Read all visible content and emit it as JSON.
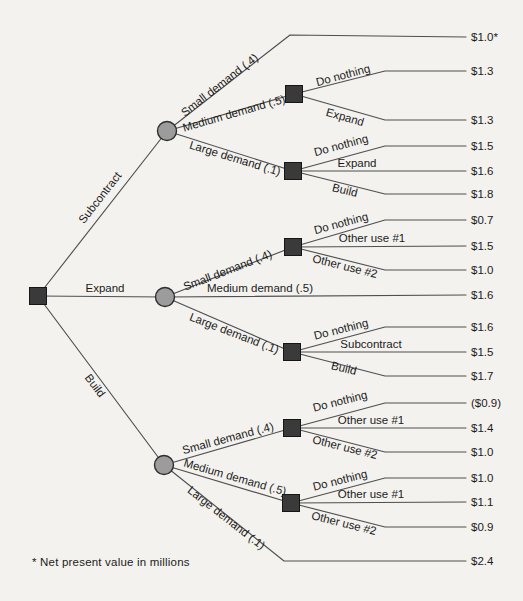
{
  "figure": {
    "kind": "decision-tree",
    "footnote": "* Net present value in millions",
    "canvas": {
      "width": 523,
      "height": 601,
      "background": "#f3f2ee"
    },
    "styles": {
      "line_color": "#4f4f4f",
      "line_width": 1.15,
      "text_color": "#1b1b1b",
      "label_font_size": 11.5,
      "value_font_size": 11.5,
      "decision_fill": "#3a3a3a",
      "decision_stroke": "#161616",
      "decision_size": 17,
      "chance_fill": "#9c9c9c",
      "chance_stroke": "#2e2e2e",
      "chance_radius": 9.5,
      "value_x": 471
    },
    "nodes": [
      {
        "name": "root-decision",
        "type": "decision",
        "x": 38,
        "y": 296
      },
      {
        "name": "subcontract-chance",
        "type": "chance",
        "x": 167,
        "y": 131
      },
      {
        "name": "expand-chance",
        "type": "chance",
        "x": 165,
        "y": 297
      },
      {
        "name": "build-chance",
        "type": "chance",
        "x": 164,
        "y": 465
      },
      {
        "name": "sub-medium-decision",
        "type": "decision",
        "x": 294,
        "y": 94
      },
      {
        "name": "sub-large-decision",
        "type": "decision",
        "x": 293,
        "y": 171
      },
      {
        "name": "exp-small-decision",
        "type": "decision",
        "x": 293,
        "y": 247
      },
      {
        "name": "exp-large-decision",
        "type": "decision",
        "x": 292,
        "y": 352
      },
      {
        "name": "build-small-decision",
        "type": "decision",
        "x": 292,
        "y": 428
      },
      {
        "name": "build-medium-decision",
        "type": "decision",
        "x": 291,
        "y": 503
      }
    ],
    "edges": [
      {
        "name": "root-subcontract",
        "points": [
          [
            38,
            296
          ],
          [
            167,
            131
          ]
        ],
        "label": {
          "text": "Subcontract",
          "x": 103,
          "y": 200,
          "rot": -52
        }
      },
      {
        "name": "root-expand",
        "points": [
          [
            38,
            296
          ],
          [
            165,
            297
          ]
        ],
        "label": {
          "text": "Expand",
          "x": 105,
          "y": 292,
          "rot": 0
        }
      },
      {
        "name": "root-build",
        "points": [
          [
            38,
            296
          ],
          [
            164,
            465
          ]
        ],
        "label": {
          "text": "Build",
          "x": 92,
          "y": 388,
          "rot": 53
        }
      },
      {
        "name": "sub-small-demand",
        "points": [
          [
            167,
            131
          ],
          [
            290,
            35
          ],
          [
            466,
            37
          ]
        ],
        "label": {
          "text": "Small demand (.4)",
          "x": 222,
          "y": 88,
          "rot": -38
        },
        "value": "$1.0*"
      },
      {
        "name": "sub-medium-demand",
        "points": [
          [
            167,
            131
          ],
          [
            294,
            94
          ]
        ],
        "label": {
          "text": "Medium demand (.5)",
          "x": 235,
          "y": 117,
          "rot": -16
        }
      },
      {
        "name": "sub-large-demand",
        "points": [
          [
            167,
            131
          ],
          [
            293,
            171
          ]
        ],
        "label": {
          "text": "Large demand (.1)",
          "x": 234,
          "y": 162,
          "rot": 17
        }
      },
      {
        "name": "sub-med-do-nothing",
        "points": [
          [
            294,
            94
          ],
          [
            385,
            71
          ],
          [
            466,
            71
          ]
        ],
        "label": {
          "text": "Do nothing",
          "x": 344,
          "y": 79,
          "rot": -15
        },
        "value": "$1.3"
      },
      {
        "name": "sub-med-expand",
        "points": [
          [
            294,
            94
          ],
          [
            385,
            120
          ],
          [
            466,
            120
          ]
        ],
        "label": {
          "text": "Expand",
          "x": 344,
          "y": 121,
          "rot": 16
        },
        "value": "$1.3"
      },
      {
        "name": "sub-lg-do-nothing",
        "points": [
          [
            293,
            171
          ],
          [
            385,
            146
          ],
          [
            466,
            146
          ]
        ],
        "label": {
          "text": "Do nothing",
          "x": 342,
          "y": 149,
          "rot": -15
        },
        "value": "$1.5"
      },
      {
        "name": "sub-lg-expand",
        "points": [
          [
            293,
            171
          ],
          [
            466,
            171
          ]
        ],
        "label": {
          "text": "Expand",
          "x": 357,
          "y": 167,
          "rot": 0
        },
        "value": "$1.6"
      },
      {
        "name": "sub-lg-build",
        "points": [
          [
            293,
            171
          ],
          [
            385,
            194
          ],
          [
            466,
            194
          ]
        ],
        "label": {
          "text": "Build",
          "x": 344,
          "y": 194,
          "rot": 14
        },
        "value": "$1.8"
      },
      {
        "name": "exp-small-demand",
        "points": [
          [
            165,
            297
          ],
          [
            293,
            247
          ]
        ],
        "label": {
          "text": "Small demand (.4)",
          "x": 229,
          "y": 274,
          "rot": -21
        }
      },
      {
        "name": "exp-medium-demand",
        "points": [
          [
            165,
            297
          ],
          [
            466,
            295
          ]
        ],
        "label": {
          "text": "Medium demand (.5)",
          "x": 260,
          "y": 292,
          "rot": 0
        },
        "value": "$1.6"
      },
      {
        "name": "exp-large-demand",
        "points": [
          [
            165,
            297
          ],
          [
            292,
            352
          ]
        ],
        "label": {
          "text": "Large demand (.1)",
          "x": 233,
          "y": 337,
          "rot": 21
        }
      },
      {
        "name": "exp-sm-do-nothing",
        "points": [
          [
            293,
            247
          ],
          [
            385,
            220
          ],
          [
            466,
            220
          ]
        ],
        "label": {
          "text": "Do nothing",
          "x": 342,
          "y": 227,
          "rot": -15
        },
        "value": "$0.7"
      },
      {
        "name": "exp-sm-other-use-1",
        "points": [
          [
            293,
            247
          ],
          [
            466,
            246
          ]
        ],
        "label": {
          "text": "Other use #1",
          "x": 372,
          "y": 242,
          "rot": 0
        },
        "value": "$1.5"
      },
      {
        "name": "exp-sm-other-use-2",
        "points": [
          [
            293,
            247
          ],
          [
            385,
            270
          ],
          [
            466,
            270
          ]
        ],
        "label": {
          "text": "Other use #2",
          "x": 344,
          "y": 270,
          "rot": 14
        },
        "value": "$1.0"
      },
      {
        "name": "exp-lg-do-nothing",
        "points": [
          [
            292,
            352
          ],
          [
            385,
            327
          ],
          [
            466,
            327
          ]
        ],
        "label": {
          "text": "Do nothing",
          "x": 342,
          "y": 333,
          "rot": -14
        },
        "value": "$1.6"
      },
      {
        "name": "exp-lg-subcontract",
        "points": [
          [
            292,
            352
          ],
          [
            466,
            352
          ]
        ],
        "label": {
          "text": "Subcontract",
          "x": 371,
          "y": 348,
          "rot": 0
        },
        "value": "$1.5"
      },
      {
        "name": "exp-lg-build",
        "points": [
          [
            292,
            352
          ],
          [
            385,
            376
          ],
          [
            466,
            376
          ]
        ],
        "label": {
          "text": "Build",
          "x": 343,
          "y": 372,
          "rot": 14
        },
        "value": "$1.7"
      },
      {
        "name": "build-small-demand",
        "points": [
          [
            164,
            465
          ],
          [
            292,
            428
          ]
        ],
        "label": {
          "text": "Small demand (.4)",
          "x": 229,
          "y": 442,
          "rot": -15
        }
      },
      {
        "name": "build-medium-demand",
        "points": [
          [
            164,
            465
          ],
          [
            291,
            503
          ]
        ],
        "label": {
          "text": "Medium demand (.5)",
          "x": 234,
          "y": 481,
          "rot": 16
        }
      },
      {
        "name": "build-large-demand",
        "points": [
          [
            164,
            465
          ],
          [
            284,
            561
          ],
          [
            466,
            561
          ]
        ],
        "label": {
          "text": "Large demand (.1)",
          "x": 224,
          "y": 521,
          "rot": 38
        },
        "value": "$2.4"
      },
      {
        "name": "bld-sm-do-nothing",
        "points": [
          [
            292,
            428
          ],
          [
            385,
            403
          ],
          [
            466,
            403
          ]
        ],
        "label": {
          "text": "Do nothing",
          "x": 341,
          "y": 405,
          "rot": -14
        },
        "value": "($0.9)"
      },
      {
        "name": "bld-sm-other-use-1",
        "points": [
          [
            292,
            428
          ],
          [
            466,
            428
          ]
        ],
        "label": {
          "text": "Other use #1",
          "x": 371,
          "y": 424,
          "rot": 0
        },
        "value": "$1.4"
      },
      {
        "name": "bld-sm-other-use-2",
        "points": [
          [
            292,
            428
          ],
          [
            385,
            452
          ],
          [
            466,
            452
          ]
        ],
        "label": {
          "text": "Other use #2",
          "x": 344,
          "y": 451,
          "rot": 14
        },
        "value": "$1.0"
      },
      {
        "name": "bld-md-do-nothing",
        "points": [
          [
            291,
            503
          ],
          [
            385,
            478
          ],
          [
            466,
            478
          ]
        ],
        "label": {
          "text": "Do nothing",
          "x": 341,
          "y": 484,
          "rot": -14
        },
        "value": "$1.0"
      },
      {
        "name": "bld-md-other-use-1",
        "points": [
          [
            291,
            503
          ],
          [
            466,
            502
          ]
        ],
        "label": {
          "text": "Other use #1",
          "x": 371,
          "y": 498,
          "rot": 0
        },
        "value": "$1.1"
      },
      {
        "name": "bld-md-other-use-2",
        "points": [
          [
            291,
            503
          ],
          [
            385,
            527
          ],
          [
            466,
            527
          ]
        ],
        "label": {
          "text": "Other use #2",
          "x": 343,
          "y": 527,
          "rot": 14
        },
        "value": "$0.9"
      }
    ]
  }
}
